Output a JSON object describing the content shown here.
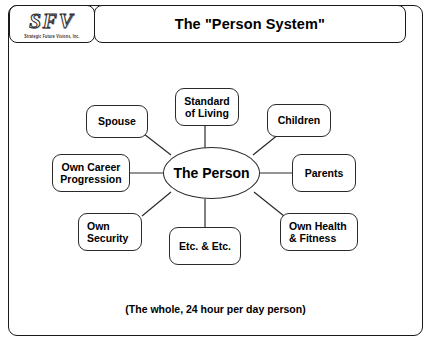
{
  "header": {
    "logo_mark": "SFV",
    "logo_subtitle": "Strategic Future Visions, Inc.",
    "title": "The \"Person System\""
  },
  "diagram": {
    "center": {
      "label": "The Person"
    },
    "nodes": [
      {
        "label": "Spouse"
      },
      {
        "label": "Standard\nof Living"
      },
      {
        "label": "Children"
      },
      {
        "label": "Own Career\nProgression"
      },
      {
        "label": "Parents"
      },
      {
        "label": "Own\nSecurity"
      },
      {
        "label": "Etc. & Etc."
      },
      {
        "label": "Own Health\n& Fitness"
      }
    ]
  },
  "footer": {
    "caption": "(The whole, 24 hour per day person)"
  }
}
